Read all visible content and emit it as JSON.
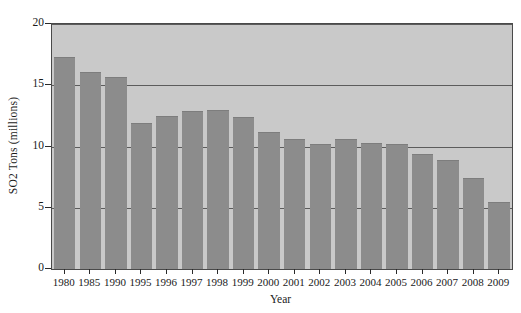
{
  "chart_data": {
    "type": "bar",
    "title": "",
    "xlabel": "Year",
    "ylabel": "SO2 Tons (millions)",
    "categories": [
      "1980",
      "1985",
      "1990",
      "1995",
      "1996",
      "1997",
      "1998",
      "1999",
      "2000",
      "2001",
      "2002",
      "2003",
      "2004",
      "2005",
      "2006",
      "2007",
      "2008",
      "2009"
    ],
    "values": [
      17.3,
      16.1,
      15.7,
      11.9,
      12.5,
      12.9,
      13.0,
      12.4,
      11.2,
      10.6,
      10.2,
      10.6,
      10.3,
      10.2,
      9.4,
      8.9,
      7.4,
      5.5
    ],
    "ylim": [
      0,
      20
    ],
    "yticks": [
      "0",
      "5",
      "10",
      "15",
      "20"
    ],
    "ytick_values": [
      0,
      5,
      10,
      15,
      20
    ],
    "gridlines": [
      5,
      10,
      15,
      20
    ],
    "grid": true,
    "legend": "none",
    "colors": {
      "bar": "#8c8c8c",
      "plot_background": "#c9c9c9",
      "gridline": "#5c5c5c",
      "axis": "#2a2a2a",
      "page_background": "#ffffff",
      "text": "#1a1a1a"
    }
  }
}
